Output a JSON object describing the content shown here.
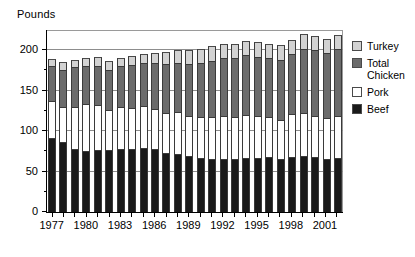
{
  "chart_data": {
    "type": "bar",
    "stacked": true,
    "title": "",
    "subtitle": "",
    "xlabel": "",
    "ylabel": "Pounds",
    "ylim": [
      0,
      225
    ],
    "ytick_labels": [
      "0",
      "50",
      "100",
      "150",
      "200"
    ],
    "ytick_values": [
      0,
      50,
      100,
      150,
      200
    ],
    "yminor_values": [
      25,
      75,
      125,
      175
    ],
    "grid": true,
    "legend_position": "right",
    "categories": [
      "1977",
      "1978",
      "1979",
      "1980",
      "1981",
      "1982",
      "1983",
      "1984",
      "1985",
      "1986",
      "1987",
      "1988",
      "1989",
      "1990",
      "1991",
      "1992",
      "1993",
      "1994",
      "1995",
      "1996",
      "1997",
      "1998",
      "1999",
      "2000",
      "2001",
      "2002"
    ],
    "xtick_labels": [
      "1977",
      "1980",
      "1983",
      "1986",
      "1989",
      "1992",
      "1995",
      "1998",
      "2001"
    ],
    "series": [
      {
        "name": "Beef",
        "color": "#1a1a1a",
        "values": [
          91,
          87,
          78,
          76,
          77,
          77,
          78,
          78,
          79,
          78,
          73,
          72,
          69,
          67,
          66,
          66,
          65,
          67,
          67,
          68,
          66,
          68,
          69,
          68,
          66,
          67
        ]
      },
      {
        "name": "Pork",
        "color": "#ffffff",
        "values": [
          46,
          43,
          52,
          57,
          55,
          49,
          52,
          51,
          52,
          49,
          49,
          52,
          50,
          50,
          51,
          53,
          52,
          53,
          52,
          49,
          48,
          53,
          54,
          51,
          50,
          52
        ]
      },
      {
        "name": "Total Chicken",
        "color": "#6b6b6b",
        "values": [
          43,
          46,
          49,
          47,
          49,
          50,
          50,
          53,
          53,
          57,
          61,
          60,
          64,
          67,
          70,
          71,
          73,
          74,
          73,
          73,
          74,
          74,
          79,
          81,
          80,
          82
        ]
      },
      {
        "name": "Turkey",
        "color": "#d2d2d2",
        "values": [
          9,
          9,
          9,
          10,
          11,
          11,
          11,
          11,
          12,
          13,
          15,
          16,
          17,
          18,
          18,
          18,
          18,
          18,
          18,
          18,
          18,
          18,
          18,
          18,
          18,
          18
        ]
      }
    ]
  },
  "legend": {
    "items": [
      {
        "label": "Turkey",
        "swatch_class": "sw-turkey",
        "name": "legend-item-turkey"
      },
      {
        "label": "Total\nChicken",
        "swatch_class": "sw-chicken",
        "name": "legend-item-total-chicken"
      },
      {
        "label": "Pork",
        "swatch_class": "sw-pork",
        "name": "legend-item-pork"
      },
      {
        "label": "Beef",
        "swatch_class": "sw-beef",
        "name": "legend-item-beef"
      }
    ]
  }
}
